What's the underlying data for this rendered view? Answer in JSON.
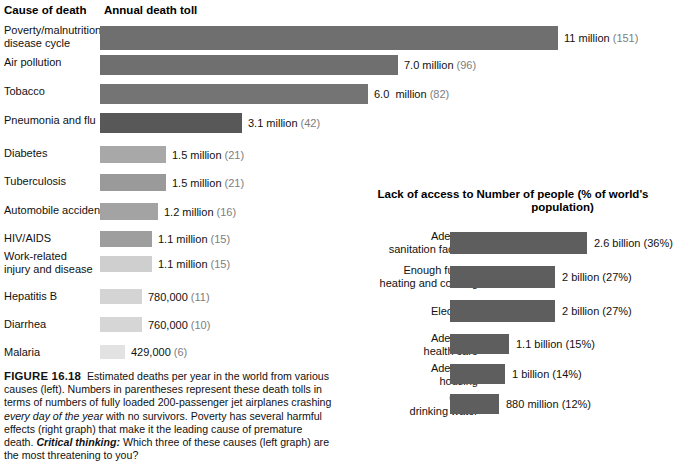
{
  "figure": {
    "number": "FIGURE 16.18",
    "caption_part1": "Estimated deaths per year in the world from various causes (left). Numbers in parentheses represent these death tolls in terms of numbers of fully loaded 200-passenger jet airplanes crashing ",
    "caption_italic": "every day of the year",
    "caption_part2": " with no survivors. Poverty has several harmful effects (right graph) that make it the leading cause of premature death. ",
    "critical_label": "Critical thinking:",
    "critical_text": " Which three of these causes (left graph) are the most threatening to you?"
  },
  "left_chart": {
    "header_category": "Cause of death",
    "header_value": "Annual death toll"
  },
  "right_chart": {
    "header_category": "Lack of\naccess to",
    "header_value": "Number of people\n(% of world's population)"
  },
  "chart_data": [
    {
      "type": "bar",
      "orientation": "horizontal",
      "id": "left",
      "title": "Annual death toll",
      "xlabel": "Annual death toll",
      "ylabel": "Cause of death",
      "grid": false,
      "legend": "none",
      "value_unit": "deaths per year",
      "paren_unit": "fully loaded 200-passenger jet airplanes crashing every day of the year",
      "categories": [
        "Poverty/malnutrition/\ndisease cycle",
        "Air pollution",
        "Tobacco",
        "Pneumonia and flu",
        "Diabetes",
        "Tuberculosis",
        "Automobile accidents",
        "HIV/AIDS",
        "Work-related\ninjury and disease",
        "Hepatitis B",
        "Diarrhea",
        "Malaria"
      ],
      "values": [
        11000000,
        7000000,
        6000000,
        3100000,
        1500000,
        1500000,
        1200000,
        1100000,
        1100000,
        780000,
        760000,
        429000
      ],
      "value_labels": [
        "11 million",
        "7.0 million",
        "6.0  million",
        "3.1 million",
        "1.5 million",
        "1.5 million",
        "1.2 million",
        "1.1 million",
        "1.1 million",
        "780,000",
        "760,000",
        "429,000"
      ],
      "paren_labels": [
        "(151)",
        "(96)",
        "(82)",
        "(42)",
        "(21)",
        "(21)",
        "(16)",
        "(15)",
        "(15)",
        "(11)",
        "(10)",
        "(6)"
      ],
      "bar_colors": [
        "#6f6f6f",
        "#6f6f6f",
        "#747474",
        "#585858",
        "#a8a8a8",
        "#9a9a9a",
        "#a3a3a3",
        "#9e9e9e",
        "#cfcfcf",
        "#d4d4d4",
        "#d6d6d6",
        "#e2e2e2"
      ],
      "bar_pixel_lengths": [
        458,
        298,
        268,
        142,
        66,
        66,
        58,
        52,
        52,
        42,
        42,
        25
      ],
      "xlim": [
        0,
        11000000
      ]
    },
    {
      "type": "bar",
      "orientation": "horizontal",
      "id": "right",
      "title": "Number of people (% of world's population)",
      "xlabel": "Number of people (% of world's population)",
      "ylabel": "Lack of access to",
      "grid": false,
      "legend": "none",
      "categories": [
        "Adequate\nsanitation facilities",
        "Enough fuel for\nheating and cooking",
        "Electricity",
        "Adequate\nhealth care",
        "Adequate\nhousing",
        "Clean\ndrinking water"
      ],
      "values": [
        2600000000,
        2000000000,
        2000000000,
        1100000000,
        1000000000,
        880000000
      ],
      "percentages": [
        36,
        27,
        27,
        15,
        14,
        12
      ],
      "value_labels": [
        "2.6 billion (36%)",
        "2 billion (27%)",
        "2 billion (27%)",
        "1.1 billion (15%)",
        "1 billion (14%)",
        "880 million (12%)"
      ],
      "bar_pixel_lengths": [
        137,
        105,
        105,
        59,
        55,
        49
      ],
      "bar_color": "#5e5e5e",
      "xlim": [
        0,
        2600000000
      ]
    }
  ]
}
